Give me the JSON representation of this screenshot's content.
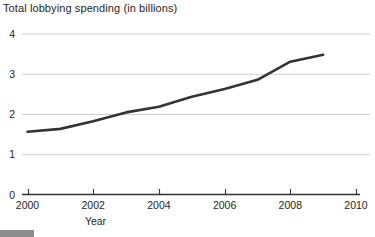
{
  "chart_data": {
    "type": "line",
    "title": "Total lobbying spending (in billions)",
    "xlabel": "Year",
    "ylabel": "",
    "x": [
      2000,
      2001,
      2002,
      2003,
      2004,
      2005,
      2006,
      2007,
      2008,
      2009
    ],
    "values": [
      1.56,
      1.63,
      1.82,
      2.04,
      2.18,
      2.43,
      2.62,
      2.85,
      3.3,
      3.47
    ],
    "series": [
      {
        "name": "Total lobbying spending",
        "values": [
          1.56,
          1.63,
          1.82,
          2.04,
          2.18,
          2.43,
          2.62,
          2.85,
          3.3,
          3.47
        ]
      }
    ],
    "xlim": [
      2000,
      2010
    ],
    "ylim": [
      0,
      4
    ],
    "xticks": [
      2000,
      2002,
      2004,
      2006,
      2008,
      2010
    ],
    "xtick_labels": [
      "2000",
      "2002",
      "2004",
      "2006",
      "2008",
      "2010"
    ],
    "yticks": [
      0,
      1,
      2,
      3,
      4
    ],
    "ytick_labels": [
      "0",
      "1",
      "2",
      "3",
      "4"
    ],
    "grid": "horizontal",
    "legend": "none",
    "line_color": "#333333",
    "grid_color": "#cfcfcf",
    "axis_color": "#333333"
  },
  "caption": {
    "badge_label": "",
    "text": ""
  }
}
